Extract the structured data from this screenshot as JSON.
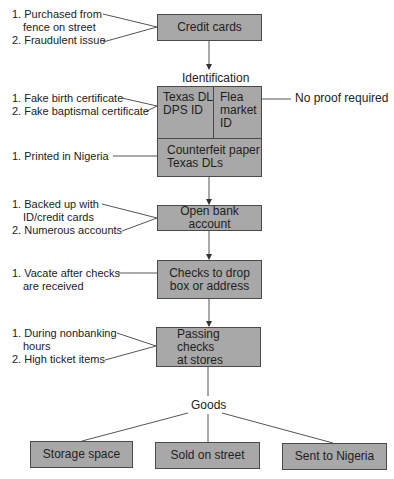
{
  "diagram": {
    "nodes": {
      "credit_cards": "Credit cards",
      "identification_label": "Identification",
      "texas_dl": [
        "Texas DL",
        "DPS ID"
      ],
      "flea_market": [
        "Flea",
        "market",
        "ID"
      ],
      "counterfeit": [
        "Counterfeit paper",
        "Texas DLs"
      ],
      "open_bank": "Open bank account",
      "checks_drop": [
        "Checks to drop",
        "box or address"
      ],
      "passing_checks": [
        "Passing checks",
        "at stores"
      ],
      "goods_label": "Goods",
      "storage_space": "Storage space",
      "sold_on_street": "Sold on street",
      "sent_to_nigeria": "Sent to Nigeria"
    },
    "notes": {
      "credit_cards": [
        "1. Purchased from",
        "fence on street",
        "2. Fraudulent issue"
      ],
      "texas_dl": [
        "1. Fake birth certificate",
        "2. Fake baptismal certificate"
      ],
      "flea_market": "No proof required",
      "counterfeit": "1. Printed in Nigeria",
      "open_bank": [
        "1. Backed up with",
        "ID/credit cards",
        "2. Numerous accounts"
      ],
      "checks_drop": [
        "1. Vacate after checks",
        "are received"
      ],
      "passing_checks": [
        "1. During nonbanking",
        "hours",
        "2. High ticket items"
      ]
    },
    "colors": {
      "box_fill": "#a8a8a8",
      "box_border": "#4a4a4a",
      "line": "#555555"
    }
  }
}
